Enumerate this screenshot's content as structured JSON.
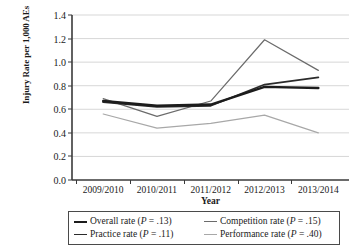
{
  "chart_data": {
    "type": "line",
    "title": "",
    "xlabel": "Year",
    "ylabel": "Injury Rate per 1,000 AEs",
    "categories": [
      "2009/2010",
      "2010/2011",
      "2011/2012",
      "2012/2013",
      "2013/2014"
    ],
    "ylim": [
      0.0,
      1.4
    ],
    "yticks": [
      "0.0",
      "0.2",
      "0.4",
      "0.6",
      "0.8",
      "1.0",
      "1.2",
      "1.4"
    ],
    "ytick_values": [
      0.0,
      0.2,
      0.4,
      0.6,
      0.8,
      1.0,
      1.2,
      1.4
    ],
    "grid": "horizontal",
    "legend_position": "bottom",
    "series": [
      {
        "name": "Overall rate",
        "legend_label": "Overall rate (P = .13)",
        "p_value": ".13",
        "color": "#1c1c1c",
        "width": 2.4,
        "values": [
          0.67,
          0.63,
          0.64,
          0.79,
          0.78
        ]
      },
      {
        "name": "Competition rate",
        "legend_label": "Competition rate (P = .15)",
        "p_value": ".15",
        "color": "#6b6b6b",
        "width": 1.2,
        "values": [
          0.69,
          0.54,
          0.67,
          1.19,
          0.93
        ]
      },
      {
        "name": "Practice rate",
        "legend_label": "Practice rate (P = .11)",
        "p_value": ".11",
        "color": "#2b2b2b",
        "width": 1.8,
        "values": [
          0.66,
          0.62,
          0.63,
          0.81,
          0.87
        ]
      },
      {
        "name": "Performance rate",
        "legend_label": "Performance rate (P = .40)",
        "p_value": ".40",
        "color": "#a8a8a8",
        "width": 1.2,
        "values": [
          0.56,
          0.44,
          0.48,
          0.55,
          0.4
        ]
      }
    ]
  },
  "axes": {
    "y_title": "Injury Rate per 1,000 AEs",
    "x_title": "Year"
  },
  "legend": {
    "entries": [
      {
        "label": "Overall rate (P = .13)",
        "prefix": "Overall rate (",
        "italic": "P",
        "suffix": " = .13)"
      },
      {
        "label": "Competition rate (P = .15)",
        "prefix": "Competition rate (",
        "italic": "P",
        "suffix": " = .15)"
      },
      {
        "label": "Practice rate (P = .11)",
        "prefix": "Practice rate (",
        "italic": "P",
        "suffix": " = .11)"
      },
      {
        "label": "Performance rate (P = .40)",
        "prefix": "Performance rate (",
        "italic": "P",
        "suffix": " = .40)"
      }
    ]
  },
  "colors": {
    "axis": "#3a3a3a",
    "grid": "#d2d2d2",
    "background": "#ffffff"
  }
}
